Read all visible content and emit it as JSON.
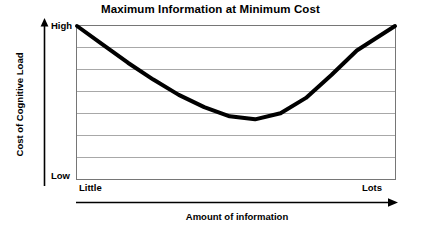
{
  "chart_data": {
    "type": "line",
    "title": "Maximum Information at Minimum Cost",
    "xlabel": "Amount of information",
    "ylabel": "Cost of Cognitive Load",
    "x_tick_labels": [
      "Little",
      "Lots"
    ],
    "y_tick_labels": [
      "High",
      "Low"
    ],
    "xlim": [
      0,
      1
    ],
    "ylim": [
      0,
      1
    ],
    "grid": true,
    "grid_rows": 7,
    "legend": null,
    "series": [
      {
        "name": "Cost of Cognitive Load",
        "color": "#000000",
        "line_width": 4,
        "description": "U-shaped convex curve: high cost at little information, minimum at moderate information, high cost again at lots of information",
        "x": [
          0.0,
          0.08,
          0.16,
          0.24,
          0.32,
          0.4,
          0.48,
          0.56,
          0.64,
          0.72,
          0.8,
          0.88,
          1.0
        ],
        "y": [
          1.0,
          0.88,
          0.76,
          0.65,
          0.55,
          0.47,
          0.41,
          0.39,
          0.43,
          0.53,
          0.68,
          0.84,
          1.0
        ]
      }
    ],
    "annotations": [
      {
        "name": "y-axis-direction-arrow",
        "direction": "up",
        "meaning": "increasing cost of cognitive load"
      },
      {
        "name": "x-axis-direction-arrow",
        "direction": "right",
        "meaning": "increasing amount of information"
      }
    ],
    "colors": {
      "curve": "#000000",
      "gridline": "#a8a8a8",
      "frame": "#767676",
      "text": "#000000",
      "background": "#ffffff"
    }
  }
}
